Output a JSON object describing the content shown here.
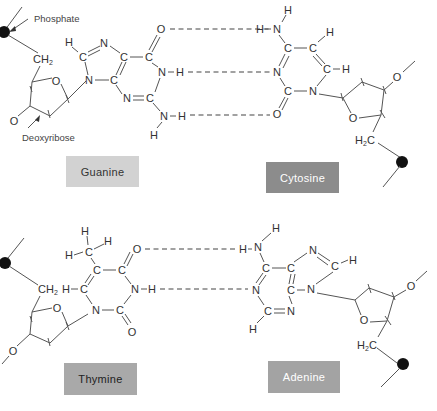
{
  "annotations": {
    "phosphate": "Phosphate",
    "deoxyribose": "Deoxyribose"
  },
  "pairs": [
    {
      "name": "G-C pair",
      "hydrogen_bonds": 3,
      "left_base": {
        "label": "Guanine",
        "box_color": "#d2d2d2",
        "text_color": "#333333"
      },
      "right_base": {
        "label": "Cytosine",
        "box_color": "#8c8c8c",
        "text_color": "#ffffff"
      }
    },
    {
      "name": "T-A pair",
      "hydrogen_bonds": 2,
      "left_base": {
        "label": "Thymine",
        "box_color": "#a9a9a9",
        "text_color": "#222222"
      },
      "right_base": {
        "label": "Adenine",
        "box_color": "#a3a3a3",
        "text_color": "#ffffff"
      }
    }
  ],
  "atoms": {
    "C": "C",
    "N": "N",
    "O": "O",
    "H": "H",
    "CH2": "CH",
    "H2C": "H",
    "sub2": "2"
  }
}
